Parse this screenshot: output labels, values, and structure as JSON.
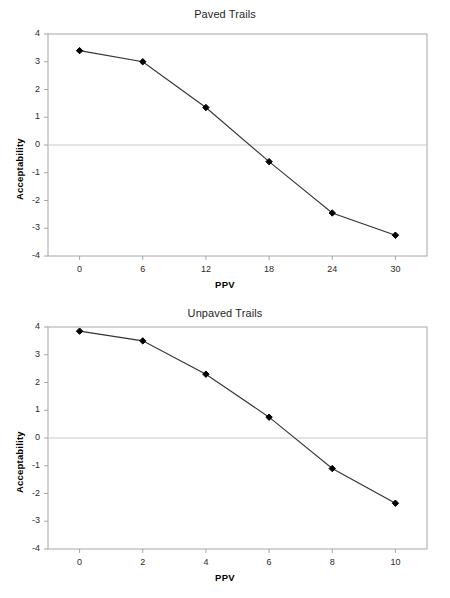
{
  "figure": {
    "background_color": "#ffffff",
    "axis_color": "#a6a6a6",
    "series_color": "#333333",
    "marker_color": "#000000",
    "zero_line_color": "#c9c9c9"
  },
  "chart_data": [
    {
      "type": "line",
      "title": "Paved Trails",
      "xlabel": "PPV",
      "ylabel": "Acceptability",
      "x": [
        0,
        6,
        12,
        18,
        24,
        30
      ],
      "values": [
        3.4,
        3.0,
        1.35,
        -0.6,
        -2.45,
        -3.25
      ],
      "xlim": [
        -3,
        33
      ],
      "ylim": [
        -4,
        4
      ],
      "xticks": [
        0,
        6,
        12,
        18,
        24,
        30
      ],
      "yticks": [
        4,
        3,
        2,
        1,
        0,
        -1,
        -2,
        -3,
        -4
      ],
      "xtick_labels": [
        "0",
        "6",
        "12",
        "18",
        "24",
        "30"
      ],
      "ytick_labels": [
        "4",
        "3",
        "2",
        "1",
        "0",
        "-1",
        "-2",
        "-3",
        "-4"
      ],
      "grid": false,
      "zero_line": true,
      "legend": "none",
      "marker": "diamond"
    },
    {
      "type": "line",
      "title": "Unpaved Trails",
      "xlabel": "PPV",
      "ylabel": "Acceptability",
      "x": [
        0,
        2,
        4,
        6,
        8,
        10
      ],
      "values": [
        3.85,
        3.5,
        2.3,
        0.75,
        -1.1,
        -2.35
      ],
      "xlim": [
        -1,
        11
      ],
      "ylim": [
        -4,
        4
      ],
      "xticks": [
        0,
        2,
        4,
        6,
        8,
        10
      ],
      "yticks": [
        4,
        3,
        2,
        1,
        0,
        -1,
        -2,
        -3,
        -4
      ],
      "xtick_labels": [
        "0",
        "2",
        "4",
        "6",
        "8",
        "10"
      ],
      "ytick_labels": [
        "4",
        "3",
        "2",
        "1",
        "0",
        "-1",
        "-2",
        "-3",
        "-4"
      ],
      "grid": false,
      "zero_line": true,
      "legend": "none",
      "marker": "diamond"
    }
  ]
}
